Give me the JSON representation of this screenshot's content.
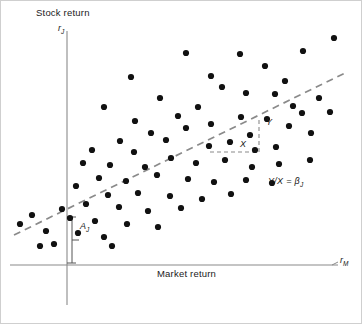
{
  "figure": {
    "title_y_axis": "Stock return",
    "title_x_axis": "Market return",
    "symbol_y_axis": "r",
    "symbol_y_axis_sub": "J",
    "symbol_x_axis": "r",
    "symbol_x_axis_sub": "M",
    "slope_annotation": "Y/X = β",
    "slope_annotation_sub": "J",
    "run_label": "X",
    "rise_label": "Y",
    "intercept_label": "A",
    "intercept_label_sub": "J",
    "colors": {
      "axis": "#8a8a8a",
      "point": "#111111",
      "regression_line": "#8a8a8a",
      "triangle": "#8a8a8a",
      "border": "#cfcfcf",
      "text": "#1a1a1a",
      "background": "#ffffff"
    }
  },
  "chart_data": {
    "type": "scatter",
    "title": "",
    "xlabel": "Market return",
    "ylabel": "Stock return",
    "xlim": [
      0,
      100
    ],
    "ylim": [
      0,
      100
    ],
    "grid": false,
    "legend": false,
    "axes": {
      "x_axis_pixel_y": 265,
      "y_axis_pixel_x": 67,
      "x_axis_pixel_start": 10,
      "x_axis_pixel_end": 338,
      "y_axis_pixel_top": 31,
      "y_axis_pixel_bottom": 305
    },
    "points": [
      [
        186,
        53
      ],
      [
        240,
        54
      ],
      [
        303,
        51
      ],
      [
        334,
        38
      ],
      [
        131,
        77
      ],
      [
        211,
        76
      ],
      [
        265,
        66
      ],
      [
        285,
        81
      ],
      [
        160,
        98
      ],
      [
        222,
        87
      ],
      [
        246,
        93
      ],
      [
        275,
        94
      ],
      [
        293,
        106
      ],
      [
        319,
        98
      ],
      [
        302,
        113
      ],
      [
        330,
        112
      ],
      [
        104,
        107
      ],
      [
        135,
        121
      ],
      [
        178,
        116
      ],
      [
        198,
        107
      ],
      [
        151,
        133
      ],
      [
        186,
        128
      ],
      [
        211,
        124
      ],
      [
        241,
        117
      ],
      [
        267,
        119
      ],
      [
        250,
        135
      ],
      [
        230,
        142
      ],
      [
        209,
        146
      ],
      [
        120,
        141
      ],
      [
        92,
        150
      ],
      [
        134,
        152
      ],
      [
        166,
        140
      ],
      [
        289,
        126
      ],
      [
        311,
        133
      ],
      [
        255,
        150
      ],
      [
        276,
        147
      ],
      [
        83,
        163
      ],
      [
        110,
        165
      ],
      [
        145,
        167
      ],
      [
        171,
        158
      ],
      [
        196,
        163
      ],
      [
        225,
        160
      ],
      [
        252,
        167
      ],
      [
        279,
        164
      ],
      [
        310,
        160
      ],
      [
        99,
        178
      ],
      [
        126,
        181
      ],
      [
        157,
        175
      ],
      [
        188,
        179
      ],
      [
        214,
        182
      ],
      [
        246,
        180
      ],
      [
        272,
        183
      ],
      [
        76,
        186
      ],
      [
        108,
        195
      ],
      [
        138,
        193
      ],
      [
        170,
        196
      ],
      [
        202,
        199
      ],
      [
        231,
        194
      ],
      [
        86,
        204
      ],
      [
        119,
        207
      ],
      [
        148,
        211
      ],
      [
        181,
        208
      ],
      [
        70,
        218
      ],
      [
        95,
        221
      ],
      [
        127,
        224
      ],
      [
        158,
        227
      ],
      [
        104,
        237
      ],
      [
        78,
        233
      ],
      [
        46,
        231
      ],
      [
        32,
        215
      ],
      [
        54,
        244
      ],
      [
        40,
        246
      ],
      [
        20,
        224
      ],
      [
        62,
        209
      ],
      [
        112,
        246
      ]
    ],
    "regression_line": {
      "style": "dashed",
      "pixel_start": [
        14,
        235
      ],
      "pixel_end": [
        345,
        73
      ],
      "slope_symbol": "β_J",
      "intercept_symbol": "A_J"
    },
    "slope_triangle": {
      "run_pixel": [
        [
          210,
          152
        ],
        [
          258,
          152
        ]
      ],
      "rise_pixel": [
        [
          258,
          152
        ],
        [
          258,
          119
        ]
      ],
      "hypotenuse_pixel": [
        [
          210,
          152
        ],
        [
          258,
          119
        ]
      ],
      "run_label": "X",
      "rise_label": "Y"
    },
    "intercept_bracket": {
      "pixel_top": [
        72,
        217
      ],
      "pixel_bottom": [
        72,
        263
      ],
      "label": "A_J"
    }
  }
}
